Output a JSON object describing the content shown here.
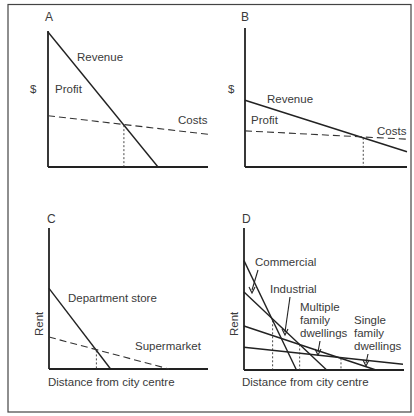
{
  "chart_data": [
    {
      "type": "line",
      "panel": "A",
      "title": "A",
      "xlabel": "",
      "ylabel": "$",
      "annotations": [
        "Profit"
      ],
      "series": [
        {
          "name": "Revenue",
          "style": "solid",
          "points": [
            [
              0,
              1.0
            ],
            [
              1.0,
              0
            ]
          ]
        },
        {
          "name": "Costs",
          "style": "dashed",
          "points": [
            [
              0,
              0.38
            ],
            [
              1.48,
              0.24
            ]
          ]
        }
      ],
      "intersections": [
        {
          "between": [
            "Revenue",
            "Costs"
          ],
          "x": 0.69,
          "marked": "dotted-drop"
        }
      ]
    },
    {
      "type": "line",
      "panel": "B",
      "title": "B",
      "xlabel": "",
      "ylabel": "$",
      "annotations": [
        "Profit"
      ],
      "series": [
        {
          "name": "Revenue",
          "style": "solid",
          "points": [
            [
              0,
              0.48
            ],
            [
              1.0,
              0.11
            ]
          ]
        },
        {
          "name": "Costs",
          "style": "dashed",
          "points": [
            [
              0,
              0.26
            ],
            [
              1.0,
              0.2
            ]
          ]
        }
      ],
      "intersections": [
        {
          "between": [
            "Revenue",
            "Costs"
          ],
          "x": 0.73,
          "marked": "dotted-drop"
        }
      ]
    },
    {
      "type": "line",
      "panel": "C",
      "title": "C",
      "xlabel": "Distance from city centre",
      "ylabel": "Rent",
      "series": [
        {
          "name": "Department store",
          "style": "solid",
          "points": [
            [
              0,
              0.58
            ],
            [
              0.39,
              0
            ]
          ]
        },
        {
          "name": "Supermarket",
          "style": "dashed",
          "points": [
            [
              0,
              0.23
            ],
            [
              0.76,
              0
            ]
          ]
        }
      ],
      "intersections": [
        {
          "between": [
            "Department store",
            "Supermarket"
          ],
          "x": 0.3,
          "marked": "dotted-drop"
        }
      ]
    },
    {
      "type": "line",
      "panel": "D",
      "title": "D",
      "xlabel": "Distance from city centre",
      "ylabel": "Rent",
      "series": [
        {
          "name": "Commercial",
          "style": "solid",
          "points": [
            [
              0,
              0.77
            ],
            [
              0.33,
              0
            ]
          ]
        },
        {
          "name": "Industrial",
          "style": "solid",
          "points": [
            [
              0,
              0.55
            ],
            [
              0.52,
              0
            ]
          ]
        },
        {
          "name": "Multiple family dwellings",
          "style": "solid",
          "points": [
            [
              0,
              0.31
            ],
            [
              0.83,
              0
            ]
          ]
        },
        {
          "name": "Single family dwellings",
          "style": "solid",
          "points": [
            [
              0,
              0.16
            ],
            [
              1.0,
              0.04
            ]
          ]
        }
      ],
      "intersections": [
        {
          "between": [
            "Commercial",
            "Industrial"
          ],
          "x": 0.18,
          "marked": "dashed-drop"
        },
        {
          "between": [
            "Industrial",
            "Multiple family dwellings"
          ],
          "x": 0.35,
          "marked": "dashed-drop"
        },
        {
          "between": [
            "Multiple family dwellings",
            "Single family dwellings"
          ],
          "x": 0.61,
          "marked": "dashed-drop"
        }
      ]
    }
  ],
  "labels": {
    "panel_a": "A",
    "panel_b": "B",
    "panel_c": "C",
    "panel_d": "D",
    "dollar": "$",
    "rent": "Rent",
    "revenue": "Revenue",
    "profit": "Profit",
    "costs": "Costs",
    "department_store": "Department store",
    "supermarket": "Supermarket",
    "distance": "Distance from city centre",
    "commercial": "Commercial",
    "industrial": "Industrial",
    "multiple_1": "Multiple",
    "multiple_2": "family",
    "multiple_3": "dwellings",
    "single_1": "Single",
    "single_2": "family",
    "single_3": "dwellings"
  }
}
